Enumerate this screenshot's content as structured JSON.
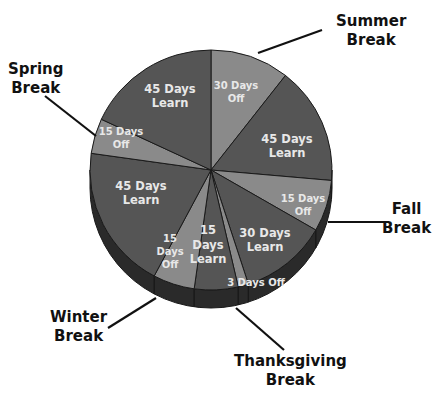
{
  "chart_data": {
    "type": "pie",
    "title": "",
    "style": "3d",
    "start_angle_deg": 0,
    "direction": "clockwise",
    "slices": [
      {
        "label": "30 Days Off",
        "line1": "30 Days",
        "line2": "Off",
        "value": 30,
        "kind": "off",
        "color": "#8a8a8a",
        "start": 0,
        "end": 38,
        "lx": 236,
        "ly": 92
      },
      {
        "label": "45 Days Learn",
        "line1": "45 Days",
        "line2": "Learn",
        "value": 45,
        "kind": "learn",
        "color": "#555555",
        "start": 38,
        "end": 95,
        "lx": 287,
        "ly": 146
      },
      {
        "label": "15 Days Off",
        "line1": "15 Days",
        "line2": "Off",
        "value": 15,
        "kind": "off",
        "color": "#8a8a8a",
        "start": 95,
        "end": 120,
        "lx": 303,
        "ly": 205
      },
      {
        "label": "30 Days Learn",
        "line1": "30 Days",
        "line2": "Learn",
        "value": 30,
        "kind": "learn",
        "color": "#555555",
        "start": 120,
        "end": 162,
        "lx": 265,
        "ly": 240
      },
      {
        "label": "3 Days Off",
        "line1": "3 Days  Off",
        "line2": "",
        "value": 3,
        "kind": "off",
        "color": "#8a8a8a",
        "start": 162,
        "end": 167,
        "lx": 256,
        "ly": 283
      },
      {
        "label": "15 Days Learn",
        "line1": "15",
        "line2": "Days",
        "line3": "Learn",
        "value": 15,
        "kind": "learn",
        "color": "#555555",
        "start": 167,
        "end": 188,
        "lx": 208,
        "ly": 245
      },
      {
        "label": "15 Days Off",
        "line1": "15",
        "line2": "Days",
        "line3": "Off",
        "value": 15,
        "kind": "off",
        "color": "#8a8a8a",
        "start": 188,
        "end": 208,
        "lx": 170,
        "ly": 252
      },
      {
        "label": "45 Days Learn",
        "line1": "45 Days",
        "line2": "Learn",
        "value": 45,
        "kind": "learn",
        "color": "#555555",
        "start": 208,
        "end": 278,
        "lx": 141,
        "ly": 193
      },
      {
        "label": "15 Days Off",
        "line1": "15 Days",
        "line2": "Off",
        "value": 15,
        "kind": "off",
        "color": "#8a8a8a",
        "start": 278,
        "end": 295,
        "lx": 121,
        "ly": 138
      },
      {
        "label": "45 Days Learn",
        "line1": "45 Days",
        "line2": "Learn",
        "value": 45,
        "kind": "learn",
        "color": "#555555",
        "start": 295,
        "end": 360,
        "lx": 170,
        "ly": 96
      }
    ],
    "callouts": [
      {
        "label": "Summer Break",
        "line1": "Summer",
        "line2": "Break",
        "x": 336,
        "y": 12,
        "x1": 258,
        "y1": 53,
        "x2": 322,
        "y2": 30
      },
      {
        "label": "Spring Break",
        "line1": "Spring",
        "line2": "Break",
        "x": 8,
        "y": 60,
        "x1": 45,
        "y1": 96,
        "x2": 96,
        "y2": 136
      },
      {
        "label": "Fall Break",
        "line1": "Fall",
        "line2": "Break",
        "x": 382,
        "y": 200,
        "x1": 328,
        "y1": 222,
        "x2": 389,
        "y2": 222
      },
      {
        "label": "Winter Break",
        "line1": "Winter",
        "line2": "Break",
        "x": 50,
        "y": 308,
        "x1": 108,
        "y1": 328,
        "x2": 156,
        "y2": 298
      },
      {
        "label": "Thanksgiving Break",
        "line1": "Thanksgiving",
        "line2": "Break",
        "x": 234,
        "y": 352,
        "x1": 236,
        "y1": 308,
        "x2": 284,
        "y2": 350
      }
    ],
    "colors": {
      "learn": "#555555",
      "off": "#8a8a8a",
      "side": "#2a2a2a",
      "edge": "#1a1a1a",
      "text": "#eeeeee",
      "callout_text": "#111111"
    }
  }
}
